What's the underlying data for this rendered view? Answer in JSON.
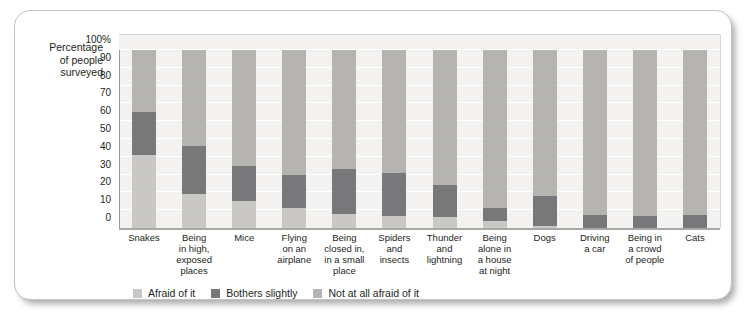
{
  "axis_title": {
    "line1": "Percentage",
    "line2": "of people",
    "line3": "surveyed"
  },
  "colors": {
    "afraid": "#c9c8c4",
    "bothers": "#78787a",
    "not_afraid": "#b5b4b0",
    "plot_background": "#f3f2f0",
    "gridline": "#ffffff",
    "axis": "#9a9997",
    "text": "#231f20",
    "card_border": "#c3c3c1"
  },
  "legend": {
    "items": [
      {
        "label": "Afraid of it",
        "color": "#c9c8c4"
      },
      {
        "label": "Bothers slightly",
        "color": "#78787a"
      },
      {
        "label": "Not at all afraid of it",
        "color": "#b5b4b0"
      }
    ]
  },
  "chart_data": {
    "type": "bar",
    "subtype": "stacked-100-percent",
    "title": "",
    "xlabel": "",
    "ylabel": "Percentage of people surveyed",
    "ylim": [
      0,
      100
    ],
    "yticks": [
      0,
      10,
      20,
      30,
      40,
      50,
      60,
      70,
      80,
      90,
      100
    ],
    "ytick_labels": [
      "0",
      "10",
      "20",
      "30",
      "40",
      "50",
      "60",
      "70",
      "80",
      "90",
      "100%"
    ],
    "grid": true,
    "legend_position": "bottom-left",
    "categories": [
      "Snakes",
      "Being in high, exposed places",
      "Mice",
      "Flying on an airplane",
      "Being closed in, in a small place",
      "Spiders and insects",
      "Thunder and lightning",
      "Being alone in a house at night",
      "Dogs",
      "Driving a car",
      "Being in a crowd of people",
      "Cats"
    ],
    "category_label_lines": [
      [
        "Snakes"
      ],
      [
        "Being",
        "in high,",
        "exposed",
        "places"
      ],
      [
        "Mice"
      ],
      [
        "Flying",
        "on an",
        "airplane"
      ],
      [
        "Being",
        "closed in,",
        "in a small",
        "place"
      ],
      [
        "Spiders",
        "and",
        "insects"
      ],
      [
        "Thunder",
        "and",
        "lightning"
      ],
      [
        "Being",
        "alone in",
        "a house",
        "at night"
      ],
      [
        "Dogs"
      ],
      [
        "Driving",
        "a car"
      ],
      [
        "Being in",
        "a crowd",
        "of people"
      ],
      [
        "Cats"
      ]
    ],
    "series": [
      {
        "name": "Afraid of it",
        "color": "#c9c8c4",
        "values": [
          41,
          19,
          15,
          11,
          8,
          7,
          6,
          4,
          1,
          0,
          0,
          0
        ]
      },
      {
        "name": "Bothers slightly",
        "color": "#78787a",
        "values": [
          24,
          27,
          20,
          18.5,
          25,
          24,
          18,
          7,
          17,
          7.5,
          7,
          7.5
        ]
      },
      {
        "name": "Not at all afraid of it",
        "color": "#b5b4b0",
        "values": [
          35,
          54,
          65,
          70.5,
          67,
          69,
          76,
          89,
          82,
          92.5,
          93,
          92.5
        ]
      }
    ]
  }
}
